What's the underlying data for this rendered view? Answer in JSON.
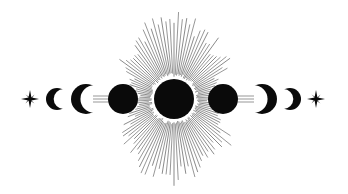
{
  "illustration": {
    "title": "Moon phases with radiant sun",
    "background": "#ffffff",
    "ink": "#0a0a0a",
    "ray_color": "#6a6a6a",
    "center": {
      "x": 174,
      "y": 99
    },
    "sun": {
      "r": 20
    },
    "rays": {
      "count": 120,
      "inner": 22,
      "max_top": 86,
      "max_side": 66,
      "min_horizontal": 40
    },
    "elements": [
      {
        "name": "star-left",
        "type": "star",
        "x": 30,
        "y": 99,
        "size": 9
      },
      {
        "name": "waxing-crescent-small",
        "type": "crescent",
        "x": 57,
        "y": 99,
        "r": 11,
        "dir": "left"
      },
      {
        "name": "waxing-crescent-large",
        "type": "crescent",
        "x": 86,
        "y": 99,
        "r": 15,
        "dir": "left",
        "thick": true
      },
      {
        "name": "full-moon-left",
        "type": "full",
        "x": 123,
        "y": 99,
        "r": 15
      },
      {
        "name": "sun-center",
        "type": "full",
        "x": 174,
        "y": 99,
        "r": 20
      },
      {
        "name": "full-moon-right",
        "type": "full",
        "x": 223,
        "y": 99,
        "r": 15
      },
      {
        "name": "waning-crescent-large",
        "type": "crescent",
        "x": 262,
        "y": 99,
        "r": 15,
        "dir": "right",
        "thick": true
      },
      {
        "name": "waning-crescent-small",
        "type": "crescent",
        "x": 290,
        "y": 99,
        "r": 11,
        "dir": "right"
      },
      {
        "name": "star-right",
        "type": "star",
        "x": 316,
        "y": 99,
        "size": 9
      }
    ]
  }
}
